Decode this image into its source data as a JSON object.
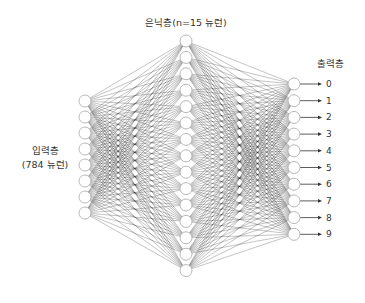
{
  "diagram": {
    "type": "fully-connected neural network",
    "layers": {
      "input": {
        "label_line1": "입력층",
        "label_line2": "(784 뉴런)",
        "drawn_nodes": 8,
        "x": 85,
        "y_start": 101,
        "y_step": 16
      },
      "hidden": {
        "label": "은닉층(n=15 뉴런)",
        "drawn_nodes": 15,
        "x": 186,
        "y_start": 41,
        "y_step": 16.4
      },
      "output": {
        "label": "출력층",
        "drawn_nodes": 10,
        "x": 294,
        "y_start": 84,
        "y_step": 16.7,
        "digits": [
          "0",
          "1",
          "2",
          "3",
          "4",
          "5",
          "6",
          "7",
          "8",
          "9"
        ]
      }
    },
    "colors": {
      "edge": "#1a1a1a",
      "node_stroke": "#b0b0b0",
      "node_fill": "#ffffff",
      "text": "#333333"
    },
    "node_radius": 6
  }
}
